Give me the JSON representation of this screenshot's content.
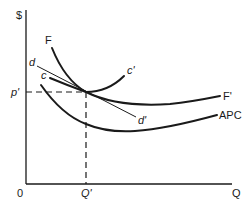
{
  "diagram": {
    "type": "economics-cost-curves",
    "axes": {
      "y_label": "$",
      "x_label": "Q",
      "origin_label": "0"
    },
    "reference": {
      "price_label": "p'",
      "quantity_label": "Q'"
    },
    "curves": [
      {
        "id": "F",
        "start_label": "F",
        "end_label": "F'",
        "description": "U-shaped curve from F to F'"
      },
      {
        "id": "c",
        "start_label": "c",
        "end_label": "c'",
        "description": "Curve from c to c', tangent at (Q', p')"
      },
      {
        "id": "d",
        "start_label": "d",
        "end_label": "d'",
        "description": "Straight line from d to d' through (Q', p')"
      },
      {
        "id": "APC",
        "end_label": "APC",
        "description": "Average production cost curve, lower U-shape"
      }
    ],
    "colors": {
      "line": "#1a1a1a",
      "background": "#ffffff"
    }
  }
}
